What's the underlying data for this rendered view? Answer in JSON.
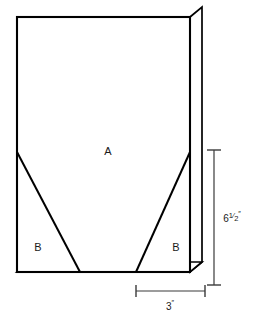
{
  "figure": {
    "background_color": "#ffffff",
    "line_color": "#000000",
    "dimension_line_color": "#3a3a3a",
    "text_color": "#1a1a1a"
  },
  "regions": {
    "main_panel_label": "A",
    "left_corner_label": "B",
    "right_corner_label": "B"
  },
  "dimensions": {
    "height": {
      "value": "6",
      "fraction_numerator": "1",
      "fraction_denominator": "2",
      "unit": "″",
      "full_label": "6½″",
      "orientation": "vertical"
    },
    "width": {
      "value": "3",
      "unit": "″",
      "full_label": "3″",
      "orientation": "horizontal"
    }
  },
  "geometry": {
    "front_face": {
      "left": 17,
      "top": 17,
      "right": 190,
      "bottom": 272
    },
    "depth_offset": {
      "x": 12,
      "y": -10
    },
    "left_diagonal": {
      "x1": 17,
      "y1": 152,
      "x2": 80,
      "y2": 272
    },
    "right_diagonal": {
      "x1": 190,
      "y1": 152,
      "x2": 136,
      "y2": 272
    },
    "vertical_dimension": {
      "x": 214,
      "y_top": 150,
      "y_bottom": 285
    },
    "horizontal_dimension": {
      "y": 291,
      "x_left": 136,
      "x_right": 205
    }
  }
}
